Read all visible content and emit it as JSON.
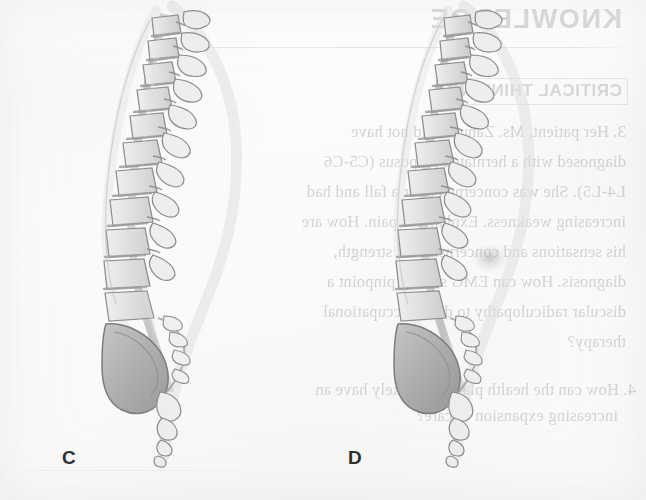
{
  "page": {
    "kind": "scanned-textbook-page",
    "background_color": "#fbfbfb",
    "width": 646,
    "height": 500
  },
  "figures": [
    {
      "id": "figure-c",
      "label": "C",
      "label_x": 62,
      "label_y": 458,
      "caption_letter": "C",
      "subject": "sagittal view of the thoracolumbar spine, sacrum and coccyx",
      "ink_color": "#8d8d8f",
      "shade_color": "#a9a9ab"
    },
    {
      "id": "figure-d",
      "label": "D",
      "label_x": 350,
      "label_y": 458,
      "caption_letter": "D",
      "subject": "sagittal view of the thoracolumbar spine, sacrum and coccyx",
      "ink_color": "#8d8d8f",
      "shade_color": "#a9a9ab"
    }
  ],
  "bleed_through": {
    "note": "Text is mirrored because it bleeds through from the reverse side of the page.",
    "heading": "KNOWLEDGE",
    "subheading": "CRITICAL THINKING",
    "body_lines": [
      "3. Her patient, Ms. Zanuck, did not have",
      "diagnosed with a herniated pulposus (C5-C6",
      "L4-L5). She was concerned after a fall and had",
      "increasing weakness. Explain his pain. How are",
      "his sensations and concerns about strength,",
      "diagnosis. How can EMG studies pinpoint a",
      "discular radiculopathy to direct occupational",
      "therapy?",
      "4. How can the health plan more likely have an",
      "increasing expansion of care?"
    ],
    "text_color": "#bbbbbd"
  },
  "labels": {
    "c": "C",
    "d": "D"
  }
}
